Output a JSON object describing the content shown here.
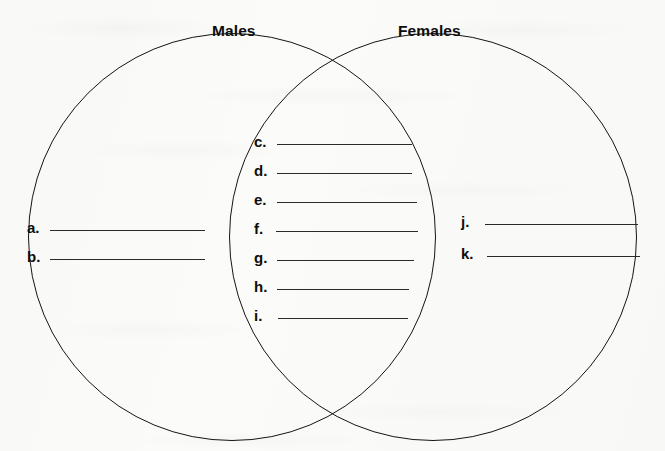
{
  "worksheet": {
    "type": "venn-diagram",
    "set_labels": {
      "left": "Males",
      "right": "Females"
    },
    "regions": {
      "left_only": {
        "name": "Males only",
        "items": [
          {
            "letter": "a.",
            "value": ""
          },
          {
            "letter": "b.",
            "value": ""
          }
        ]
      },
      "intersection": {
        "name": "Both Males and Females",
        "items": [
          {
            "letter": "c.",
            "value": ""
          },
          {
            "letter": "d.",
            "value": ""
          },
          {
            "letter": "e.",
            "value": ""
          },
          {
            "letter": "f.",
            "value": ""
          },
          {
            "letter": "g.",
            "value": ""
          },
          {
            "letter": "h.",
            "value": ""
          },
          {
            "letter": "i.",
            "value": ""
          }
        ]
      },
      "right_only": {
        "name": "Females only",
        "items": [
          {
            "letter": "j.",
            "value": ""
          },
          {
            "letter": "k.",
            "value": ""
          }
        ]
      }
    },
    "colors": {
      "ink": "#141414",
      "rule": "#2a2a2a",
      "paper": "#fbfbfa"
    }
  }
}
